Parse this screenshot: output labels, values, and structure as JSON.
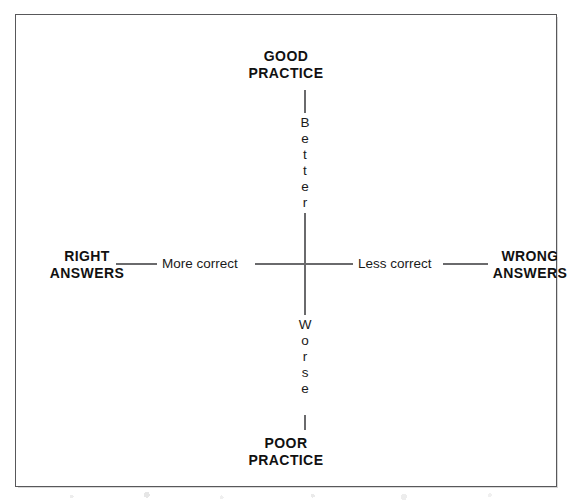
{
  "chart_data": {
    "type": "diagram",
    "subtype": "four-quadrant-axis-map",
    "title": "",
    "axes": [
      {
        "name": "vertical",
        "orientation": "vertical",
        "positive_pole": "GOOD PRACTICE",
        "negative_pole": "POOR PRACTICE",
        "positive_descriptor": "Better",
        "negative_descriptor": "Worse"
      },
      {
        "name": "horizontal",
        "orientation": "horizontal",
        "positive_pole": "RIGHT ANSWERS",
        "negative_pole": "WRONG ANSWERS",
        "positive_descriptor": "More correct",
        "negative_descriptor": "Less correct"
      }
    ],
    "grid": false,
    "legend": false
  },
  "frame": {
    "border_color": "#58585a"
  },
  "poles": {
    "top": {
      "line1": "GOOD",
      "line2": "PRACTICE"
    },
    "bottom": {
      "line1": "POOR",
      "line2": "PRACTICE"
    },
    "left": {
      "line1": "RIGHT",
      "line2": "ANSWERS"
    },
    "right": {
      "line1": "WRONG",
      "line2": "ANSWERS"
    }
  },
  "descriptors": {
    "left": "More correct",
    "right": "Less correct",
    "up": {
      "text": "Better",
      "letters": [
        "B",
        "e",
        "t",
        "t",
        "e",
        "r"
      ]
    },
    "down": {
      "text": "Worse",
      "letters": [
        "W",
        "o",
        "r",
        "s",
        "e"
      ]
    }
  }
}
